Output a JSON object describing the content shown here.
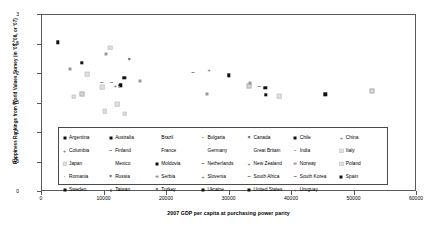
{
  "chart_data": {
    "type": "scatter",
    "title": "",
    "xlabel": "2007 GDP per capita at purchasing power parity",
    "ylabel": "Happiness Rankings from World Values Survey (in '05, '06, or '07)",
    "xlim": [
      0,
      60000
    ],
    "ylim": [
      0,
      3
    ],
    "xticks": [
      "0",
      "10000",
      "20000",
      "30000",
      "40000",
      "50000",
      "60000"
    ],
    "yticks": [
      "0",
      "0.5",
      "1",
      "1.5",
      "2",
      "2.5",
      "3"
    ],
    "grid": false,
    "legend_position": "inside-lower-center",
    "points": [
      {
        "label": "Argentina",
        "x": 2700,
        "y": 2.52,
        "marker": "square-filled"
      },
      {
        "label": "Chile",
        "x": 4700,
        "y": 2.06,
        "marker": "square-grey"
      },
      {
        "label": "Australia",
        "x": 6500,
        "y": 2.17,
        "marker": "square-filled"
      },
      {
        "label": "Brazil",
        "x": 6600,
        "y": 1.65,
        "marker": "square-open"
      },
      {
        "label": "Bulgaria",
        "x": 9700,
        "y": 1.85,
        "marker": "dash"
      },
      {
        "label": "Canada",
        "x": 9800,
        "y": 1.76,
        "marker": "square-light"
      },
      {
        "label": "China",
        "x": 10400,
        "y": 2.32,
        "marker": "square-grey"
      },
      {
        "label": "Columbia",
        "x": 11100,
        "y": 2.43,
        "marker": "square-light"
      },
      {
        "label": "Finland",
        "x": 11300,
        "y": 1.85,
        "marker": "dash"
      },
      {
        "label": "France",
        "x": 12200,
        "y": 1.47,
        "marker": "square-light"
      },
      {
        "label": "Germany",
        "x": 12600,
        "y": 1.8,
        "marker": "diamond-filled"
      },
      {
        "label": "Great Britain",
        "x": 12800,
        "y": 1.79,
        "marker": "square-filled"
      },
      {
        "label": "India",
        "x": 11900,
        "y": 1.77,
        "marker": "plus"
      },
      {
        "label": "Italy",
        "x": 12400,
        "y": 1.76,
        "marker": "dot"
      },
      {
        "label": "Japan",
        "x": 13300,
        "y": 1.92,
        "marker": "square-filled"
      },
      {
        "label": "Mexico",
        "x": 14100,
        "y": 2.24,
        "marker": "x-mark"
      },
      {
        "label": "Moldovia",
        "x": 15800,
        "y": 1.87,
        "marker": "square-grey"
      },
      {
        "label": "Netherlands",
        "x": 10200,
        "y": 1.35,
        "marker": "square-light"
      },
      {
        "label": "New Zealand",
        "x": 24300,
        "y": 2.02,
        "marker": "dash"
      },
      {
        "label": "Norway",
        "x": 26500,
        "y": 1.65,
        "marker": "square-grey"
      },
      {
        "label": "Poland",
        "x": 26900,
        "y": 2.03,
        "marker": "plus"
      },
      {
        "label": "Romania",
        "x": 30000,
        "y": 1.96,
        "marker": "square-filled"
      },
      {
        "label": "Russia",
        "x": 33200,
        "y": 1.78,
        "marker": "square-open"
      },
      {
        "label": "Serbia",
        "x": 33500,
        "y": 1.83,
        "marker": "square-grey"
      },
      {
        "label": "Slovenia",
        "x": 34900,
        "y": 1.78,
        "marker": "dash"
      },
      {
        "label": "South Africa",
        "x": 35900,
        "y": 1.75,
        "marker": "square-filled"
      },
      {
        "label": "South Korea",
        "x": 36000,
        "y": 1.63,
        "marker": "square-filled"
      },
      {
        "label": "Spain",
        "x": 38000,
        "y": 1.61,
        "marker": "square-grey"
      },
      {
        "label": "Sweden",
        "x": 38100,
        "y": 1.61,
        "marker": "square-light"
      },
      {
        "label": "Taiwan",
        "x": 45500,
        "y": 1.64,
        "marker": "square-filled"
      },
      {
        "label": "Turkey",
        "x": 53000,
        "y": 1.69,
        "marker": "square-open"
      },
      {
        "label": "Ukraine",
        "x": 7400,
        "y": 1.98,
        "marker": "square-light"
      },
      {
        "label": "United States",
        "x": 5200,
        "y": 1.6,
        "marker": "square-light"
      },
      {
        "label": "Uruguay",
        "x": 13400,
        "y": 1.31,
        "marker": "square-light"
      }
    ]
  },
  "legend": {
    "items": [
      {
        "label": "Argentina",
        "marker": "square-filled"
      },
      {
        "label": "Australia",
        "marker": "square-filled"
      },
      {
        "label": "Brazil",
        "marker": "none"
      },
      {
        "label": "Bulgaria",
        "marker": "dot"
      },
      {
        "label": "Canada",
        "marker": "x-mark"
      },
      {
        "label": "Chile",
        "marker": "square-filled"
      },
      {
        "label": "China",
        "marker": "plus"
      },
      {
        "label": "Columbia",
        "marker": "plus"
      },
      {
        "label": "Finland",
        "marker": "dash"
      },
      {
        "label": "France",
        "marker": "none"
      },
      {
        "label": "Germany",
        "marker": "none"
      },
      {
        "label": "Great Britain",
        "marker": "none"
      },
      {
        "label": "India",
        "marker": "dot"
      },
      {
        "label": "Italy",
        "marker": "square-light"
      },
      {
        "label": "Japan",
        "marker": "square-light"
      },
      {
        "label": "Mexico",
        "marker": "none"
      },
      {
        "label": "Moldovia",
        "marker": "square-filled"
      },
      {
        "label": "Netherlands",
        "marker": "dash"
      },
      {
        "label": "New Zealand",
        "marker": "plus"
      },
      {
        "label": "Norway",
        "marker": "square-grey"
      },
      {
        "label": "Poland",
        "marker": "square-light"
      },
      {
        "label": "Romania",
        "marker": "dot"
      },
      {
        "label": "Russia",
        "marker": "x-mark"
      },
      {
        "label": "Serbia",
        "marker": "square-grey"
      },
      {
        "label": "Slovenia",
        "marker": "plus"
      },
      {
        "label": "South Africa",
        "marker": "dash"
      },
      {
        "label": "South Korea",
        "marker": "dash"
      },
      {
        "label": "Spain",
        "marker": "square-filled"
      },
      {
        "label": "Sweden",
        "marker": "square-filled"
      },
      {
        "label": "Taiwan",
        "marker": "triangle"
      },
      {
        "label": "Turkey",
        "marker": "x-mark"
      },
      {
        "label": "Ukraine",
        "marker": "square-filled"
      },
      {
        "label": "United States",
        "marker": "square-filled"
      },
      {
        "label": "Uruguay",
        "marker": "plus"
      }
    ]
  }
}
